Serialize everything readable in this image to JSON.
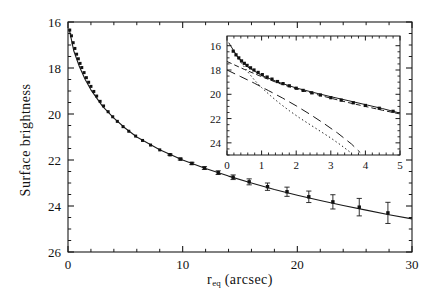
{
  "figure": {
    "xlabel_main": "r",
    "xlabel_sub": "eq",
    "xlabel_unit": " (arcsec)",
    "ylabel": "Surface brightness"
  },
  "chart_data": {
    "type": "scatter",
    "title": "",
    "xlabel": "r_eq (arcsec)",
    "ylabel": "Surface brightness",
    "xlim": [
      0,
      30
    ],
    "ylim": [
      26,
      16
    ],
    "y_inverted": true,
    "grid": false,
    "legend": "none",
    "xticks": [
      0,
      10,
      20,
      30
    ],
    "xticklabels": [
      "0",
      "10",
      "20",
      "30"
    ],
    "yticks": [
      16,
      18,
      20,
      22,
      24,
      26
    ],
    "yticklabels": [
      "16",
      "18",
      "20",
      "22",
      "24",
      "26"
    ],
    "x_minor_step": 2,
    "y_minor_step": 0.5,
    "series": [
      {
        "name": "observed profile",
        "marker": "filled-square",
        "x": [
          0.15,
          0.3,
          0.45,
          0.6,
          0.75,
          0.9,
          1.05,
          1.2,
          1.4,
          1.6,
          1.8,
          2.0,
          2.25,
          2.5,
          2.8,
          3.1,
          3.5,
          3.9,
          4.3,
          4.8,
          5.3,
          5.9,
          6.5,
          7.2,
          8.0,
          8.9,
          9.8,
          10.8,
          11.9,
          13.1,
          14.4,
          15.8,
          17.4,
          19.1,
          21.0,
          23.1,
          25.4,
          27.9
        ],
        "y": [
          16.35,
          16.6,
          16.9,
          17.15,
          17.4,
          17.6,
          17.8,
          17.98,
          18.2,
          18.42,
          18.62,
          18.8,
          19.02,
          19.22,
          19.45,
          19.65,
          19.9,
          20.12,
          20.32,
          20.55,
          20.75,
          20.96,
          21.15,
          21.35,
          21.56,
          21.77,
          21.96,
          22.15,
          22.35,
          22.55,
          22.75,
          22.95,
          23.16,
          23.38,
          23.6,
          23.82,
          24.05,
          24.3
        ],
        "yerr": [
          0.0,
          0.0,
          0.0,
          0.0,
          0.0,
          0.0,
          0.0,
          0.0,
          0.0,
          0.0,
          0.0,
          0.0,
          0.0,
          0.0,
          0.0,
          0.0,
          0.0,
          0.0,
          0.0,
          0.0,
          0.0,
          0.0,
          0.0,
          0.0,
          0.0,
          0.03,
          0.04,
          0.05,
          0.06,
          0.08,
          0.1,
          0.13,
          0.16,
          0.2,
          0.25,
          0.31,
          0.38,
          0.46
        ]
      },
      {
        "name": "model fit",
        "style": "solid-line",
        "x": [
          0.1,
          0.5,
          1.0,
          1.5,
          2.0,
          3.0,
          4.0,
          5.0,
          6.0,
          8.0,
          10.0,
          12.0,
          14.0,
          16.0,
          18.0,
          20.0,
          22.0,
          24.0,
          26.0,
          28.0,
          30.0
        ],
        "y": [
          16.3,
          17.25,
          17.95,
          18.5,
          18.95,
          19.66,
          20.18,
          20.62,
          21.0,
          21.55,
          22.0,
          22.37,
          22.7,
          23.0,
          23.28,
          23.53,
          23.76,
          23.98,
          24.18,
          24.38,
          24.56
        ]
      }
    ]
  },
  "inset": {
    "type": "scatter",
    "xlabel": "",
    "ylabel": "",
    "xlim": [
      0,
      5
    ],
    "ylim": [
      25,
      15.2
    ],
    "y_inverted": true,
    "grid": false,
    "xticks": [
      0,
      1,
      2,
      3,
      4,
      5
    ],
    "xticklabels": [
      "0",
      "1",
      "2",
      "3",
      "4",
      "5"
    ],
    "yticks": [
      16,
      18,
      20,
      22,
      24
    ],
    "yticklabels": [
      "16",
      "18",
      "20",
      "22",
      "24"
    ],
    "x_minor_step": 0.2,
    "y_minor_step": 0.5,
    "series": [
      {
        "name": "observed profile",
        "marker": "filled-square",
        "x": [
          0.18,
          0.26,
          0.34,
          0.42,
          0.5,
          0.58,
          0.68,
          0.78,
          0.9,
          1.02,
          1.16,
          1.3,
          1.46,
          1.62,
          1.8,
          2.0,
          2.2,
          2.45,
          2.7,
          3.0,
          3.3,
          3.65,
          4.0,
          4.4,
          4.8
        ],
        "y": [
          16.45,
          16.75,
          17.0,
          17.25,
          17.45,
          17.62,
          17.82,
          18.0,
          18.2,
          18.38,
          18.58,
          18.75,
          18.95,
          19.12,
          19.3,
          19.5,
          19.68,
          19.88,
          20.06,
          20.28,
          20.48,
          20.7,
          20.92,
          21.15,
          21.4
        ]
      },
      {
        "name": "total model",
        "style": "solid-line",
        "x": [
          0.05,
          0.3,
          0.6,
          1.0,
          1.5,
          2.0,
          2.5,
          3.0,
          3.5,
          4.0,
          4.5,
          5.0
        ],
        "y": [
          15.75,
          16.9,
          17.75,
          18.45,
          19.02,
          19.48,
          19.85,
          20.2,
          20.52,
          20.85,
          21.18,
          21.55
        ]
      },
      {
        "name": "disk component",
        "style": "short-dashed",
        "x": [
          0.0,
          0.5,
          1.0,
          1.5,
          2.0,
          2.5,
          3.0,
          3.5,
          4.0,
          4.5,
          5.0
        ],
        "y": [
          17.3,
          17.95,
          18.55,
          19.1,
          19.55,
          19.95,
          20.32,
          20.68,
          21.0,
          21.32,
          21.62
        ]
      },
      {
        "name": "bulge component",
        "style": "long-dashed",
        "x": [
          0.0,
          0.4,
          0.8,
          1.2,
          1.6,
          2.0,
          2.4,
          2.8,
          3.2,
          3.6,
          3.85
        ],
        "y": [
          18.0,
          18.55,
          19.1,
          19.7,
          20.3,
          20.95,
          21.65,
          22.4,
          23.2,
          24.1,
          24.8
        ]
      },
      {
        "name": "nuclear component",
        "style": "dotted",
        "x": [
          0.22,
          0.4,
          0.6,
          0.8,
          1.0,
          1.25,
          1.5,
          1.8,
          2.1,
          2.4,
          2.7,
          3.0,
          3.3,
          3.55
        ],
        "y": [
          16.55,
          17.35,
          18.15,
          18.85,
          19.45,
          20.1,
          20.7,
          21.35,
          21.95,
          22.5,
          23.05,
          23.6,
          24.2,
          24.75
        ]
      }
    ]
  }
}
